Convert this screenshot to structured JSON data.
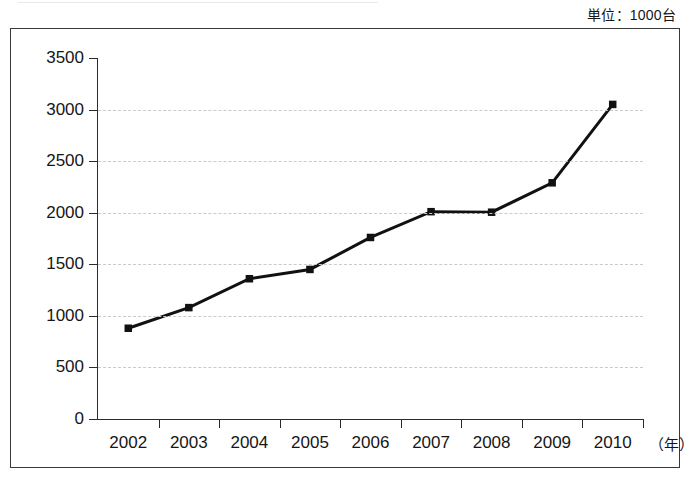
{
  "unit_note": "単位：1000台",
  "chart_data": {
    "type": "line",
    "title": "",
    "subtitle": "",
    "xlabel": "（年）",
    "ylabel": "",
    "unit_note": "単位：1000台",
    "categories": [
      "2002",
      "2003",
      "2004",
      "2005",
      "2006",
      "2007",
      "2008",
      "2009",
      "2010"
    ],
    "values": [
      880,
      1080,
      1360,
      1450,
      1760,
      2010,
      2005,
      2290,
      3050
    ],
    "series": [
      {
        "name": "",
        "values": [
          880,
          1080,
          1360,
          1450,
          1760,
          2010,
          2005,
          2290,
          3050
        ]
      }
    ],
    "ylim": [
      0,
      3500
    ],
    "yticks": [
      0,
      500,
      1000,
      1500,
      2000,
      2500,
      3000,
      3500
    ],
    "ytick_labels": [
      "0",
      "500",
      "1000",
      "1500",
      "2000",
      "2500",
      "3000",
      "3500"
    ],
    "xtick_labels": [
      "2002",
      "2003",
      "2004",
      "2005",
      "2006",
      "2007",
      "2008",
      "2009",
      "2010"
    ],
    "grid": true,
    "grid_axis": "y",
    "grid_style": "dashed",
    "legend": false,
    "legend_position": "none",
    "marker": "square",
    "line_color": "#111111",
    "marker_color": "#111111",
    "grid_color": "#c9c9cf",
    "axis_color": "#2b2b2b",
    "background_color": "#ffffff"
  }
}
